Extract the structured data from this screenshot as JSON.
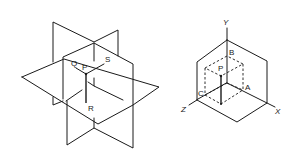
{
  "figure_left": {
    "description": "Three mutually perpendicular planes intersecting at point P",
    "labels": {
      "p": "P",
      "q": "Q",
      "r": "R",
      "s": "S"
    }
  },
  "figure_right": {
    "description": "Coordinate axes with point P and its projections A, B, C",
    "labels": {
      "x": "X",
      "y": "Y",
      "z": "Z",
      "p": "P",
      "a": "A",
      "b": "B",
      "c": "C"
    }
  },
  "colors": {
    "line": "#1a1a1a",
    "background": "#ffffff"
  }
}
